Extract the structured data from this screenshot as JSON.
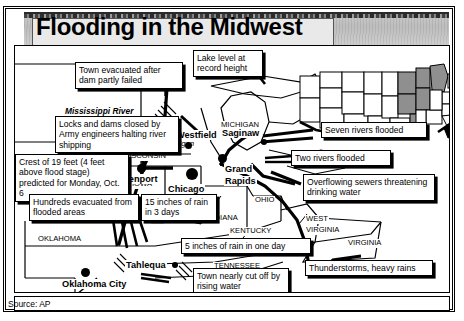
{
  "title": "Flooding in the Midwest",
  "source": {
    "label": "Source: AP"
  },
  "callouts": [
    {
      "id": "dam",
      "text": "Town evacuated after dam partly failed"
    },
    {
      "id": "lake",
      "text": "Lake level at record height"
    },
    {
      "id": "locks",
      "text": "Locks and dams closed by Army engineers halting river shipping"
    },
    {
      "id": "crest",
      "text": "Crest of 19 feet (4 feet above flood stage) predicted for Monday, Oct. 6"
    },
    {
      "id": "hundreds",
      "text": "Hundreds evacuated from flooded areas"
    },
    {
      "id": "rain15",
      "text": "15 inches of rain in 3 days"
    },
    {
      "id": "rain5",
      "text": "5 inches of rain in one day"
    },
    {
      "id": "seven",
      "text": "Seven rivers flooded"
    },
    {
      "id": "two",
      "text": "Two rivers flooded"
    },
    {
      "id": "sewers",
      "text": "Overflowing sewers threatening drinking water"
    },
    {
      "id": "cutoff",
      "text": "Town nearly cut off by rising water"
    },
    {
      "id": "storms",
      "text": "Thunderstorms, heavy rains"
    }
  ],
  "rivers": [
    {
      "name": "Mississippi River"
    }
  ],
  "waters": [
    {
      "name": "Lake"
    },
    {
      "name": "Michigan"
    }
  ],
  "states": [
    {
      "name": "WISCONSIN"
    },
    {
      "name": "MICHIGAN"
    },
    {
      "name": "IOWA"
    },
    {
      "name": "MISSOURI"
    },
    {
      "name": "ILLINOIS"
    },
    {
      "name": "INDIANA"
    },
    {
      "name": "OHIO"
    },
    {
      "name": "KENTUCKY"
    },
    {
      "name": "WEST"
    },
    {
      "name": "VIRGINIA"
    },
    {
      "name": "VIRGINIA"
    },
    {
      "name": "TENNESSEE"
    },
    {
      "name": "KANSAS"
    },
    {
      "name": "OKLAHOMA"
    }
  ],
  "cities": [
    {
      "name": "Westfield"
    },
    {
      "name": "Saginaw"
    },
    {
      "name": "Grand"
    },
    {
      "name": "Rapids"
    },
    {
      "name": "Davenport"
    },
    {
      "name": "Chicago"
    },
    {
      "name": "Tahlequa"
    },
    {
      "name": "Oklahoma  City"
    }
  ],
  "colors": {
    "ink": "#000000",
    "paper": "#ffffff",
    "title_band": "#c4c4c4",
    "inset_shade": "#8f8f8f"
  }
}
